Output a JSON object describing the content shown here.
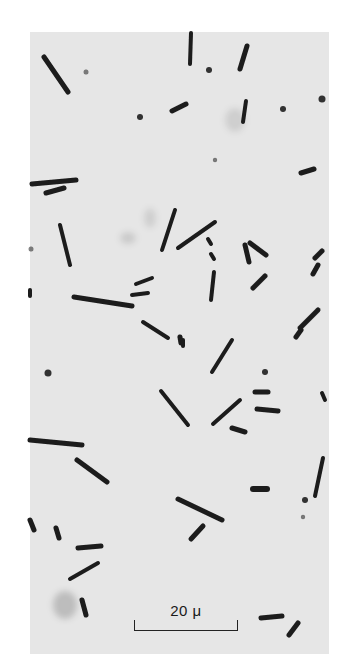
{
  "figure": {
    "type": "phase-contrast micrograph",
    "background_color": "#e6e6e6",
    "page_color": "#ffffff",
    "cell_color": "#1c1c1c",
    "frame": {
      "x": 30,
      "y": 32,
      "width": 299,
      "height": 622
    }
  },
  "scale_bar": {
    "label": "20 μ",
    "x_start": 134,
    "x_end": 238,
    "y": 631
  },
  "cells": [
    {
      "x1": 44,
      "y1": 57,
      "x2": 68,
      "y2": 92,
      "w": 5
    },
    {
      "x1": 191,
      "y1": 33,
      "x2": 190,
      "y2": 64,
      "w": 4
    },
    {
      "x1": 247,
      "y1": 46,
      "x2": 240,
      "y2": 69,
      "w": 5
    },
    {
      "x1": 172,
      "y1": 111,
      "x2": 186,
      "y2": 104,
      "w": 5
    },
    {
      "x1": 246,
      "y1": 101,
      "x2": 243,
      "y2": 122,
      "w": 4
    },
    {
      "x1": 301,
      "y1": 173,
      "x2": 314,
      "y2": 169,
      "w": 5
    },
    {
      "x1": 32,
      "y1": 184,
      "x2": 76,
      "y2": 180,
      "w": 5
    },
    {
      "x1": 46,
      "y1": 193,
      "x2": 64,
      "y2": 188,
      "w": 5
    },
    {
      "x1": 60,
      "y1": 225,
      "x2": 70,
      "y2": 265,
      "w": 4
    },
    {
      "x1": 175,
      "y1": 210,
      "x2": 162,
      "y2": 250,
      "w": 4
    },
    {
      "x1": 178,
      "y1": 248,
      "x2": 215,
      "y2": 222,
      "w": 4
    },
    {
      "x1": 208,
      "y1": 239,
      "x2": 211,
      "y2": 244,
      "w": 4
    },
    {
      "x1": 211,
      "y1": 254,
      "x2": 214,
      "y2": 259,
      "w": 4
    },
    {
      "x1": 74,
      "y1": 297,
      "x2": 132,
      "y2": 306,
      "w": 5
    },
    {
      "x1": 132,
      "y1": 295,
      "x2": 148,
      "y2": 293,
      "w": 4
    },
    {
      "x1": 136,
      "y1": 284,
      "x2": 152,
      "y2": 278,
      "w": 4
    },
    {
      "x1": 245,
      "y1": 245,
      "x2": 249,
      "y2": 262,
      "w": 5
    },
    {
      "x1": 250,
      "y1": 243,
      "x2": 266,
      "y2": 255,
      "w": 5
    },
    {
      "x1": 253,
      "y1": 288,
      "x2": 265,
      "y2": 276,
      "w": 5
    },
    {
      "x1": 214,
      "y1": 272,
      "x2": 211,
      "y2": 300,
      "w": 4
    },
    {
      "x1": 322,
      "y1": 251,
      "x2": 315,
      "y2": 258,
      "w": 5
    },
    {
      "x1": 318,
      "y1": 265,
      "x2": 313,
      "y2": 274,
      "w": 5
    },
    {
      "x1": 300,
      "y1": 328,
      "x2": 318,
      "y2": 310,
      "w": 5
    },
    {
      "x1": 296,
      "y1": 337,
      "x2": 301,
      "y2": 330,
      "w": 5
    },
    {
      "x1": 143,
      "y1": 322,
      "x2": 168,
      "y2": 338,
      "w": 4
    },
    {
      "x1": 180,
      "y1": 337,
      "x2": 181,
      "y2": 343,
      "w": 5
    },
    {
      "x1": 212,
      "y1": 372,
      "x2": 232,
      "y2": 340,
      "w": 4
    },
    {
      "x1": 183,
      "y1": 340,
      "x2": 183,
      "y2": 346,
      "w": 4
    },
    {
      "x1": 30,
      "y1": 440,
      "x2": 82,
      "y2": 445,
      "w": 5
    },
    {
      "x1": 161,
      "y1": 391,
      "x2": 188,
      "y2": 425,
      "w": 4
    },
    {
      "x1": 213,
      "y1": 424,
      "x2": 240,
      "y2": 400,
      "w": 4
    },
    {
      "x1": 232,
      "y1": 428,
      "x2": 245,
      "y2": 432,
      "w": 5
    },
    {
      "x1": 257,
      "y1": 409,
      "x2": 278,
      "y2": 411,
      "w": 5
    },
    {
      "x1": 255,
      "y1": 392,
      "x2": 268,
      "y2": 392,
      "w": 5
    },
    {
      "x1": 77,
      "y1": 460,
      "x2": 107,
      "y2": 482,
      "w": 5
    },
    {
      "x1": 30,
      "y1": 520,
      "x2": 34,
      "y2": 530,
      "w": 5
    },
    {
      "x1": 56,
      "y1": 528,
      "x2": 59,
      "y2": 538,
      "w": 5
    },
    {
      "x1": 78,
      "y1": 548,
      "x2": 101,
      "y2": 546,
      "w": 5
    },
    {
      "x1": 70,
      "y1": 579,
      "x2": 98,
      "y2": 563,
      "w": 4
    },
    {
      "x1": 178,
      "y1": 499,
      "x2": 222,
      "y2": 520,
      "w": 5
    },
    {
      "x1": 191,
      "y1": 539,
      "x2": 203,
      "y2": 526,
      "w": 5
    },
    {
      "x1": 253,
      "y1": 489,
      "x2": 267,
      "y2": 489,
      "w": 6
    },
    {
      "x1": 323,
      "y1": 458,
      "x2": 315,
      "y2": 496,
      "w": 4
    },
    {
      "x1": 322,
      "y1": 393,
      "x2": 325,
      "y2": 400,
      "w": 4
    },
    {
      "x1": 82,
      "y1": 600,
      "x2": 86,
      "y2": 615,
      "w": 5
    },
    {
      "x1": 261,
      "y1": 618,
      "x2": 282,
      "y2": 616,
      "w": 5
    },
    {
      "x1": 289,
      "y1": 635,
      "x2": 298,
      "y2": 623,
      "w": 5
    },
    {
      "x1": 30,
      "y1": 290,
      "x2": 30,
      "y2": 296,
      "w": 4
    }
  ],
  "dots": [
    {
      "x": 48,
      "y": 373,
      "r": 3.5
    },
    {
      "x": 140,
      "y": 117,
      "r": 3
    },
    {
      "x": 265,
      "y": 372,
      "r": 3
    },
    {
      "x": 305,
      "y": 500,
      "r": 3
    },
    {
      "x": 303,
      "y": 517,
      "r": 2.2
    },
    {
      "x": 322,
      "y": 99,
      "r": 3.5
    },
    {
      "x": 215,
      "y": 160,
      "r": 2.2
    },
    {
      "x": 31,
      "y": 249,
      "r": 2.5
    },
    {
      "x": 86,
      "y": 72,
      "r": 2.5
    },
    {
      "x": 209,
      "y": 70,
      "r": 3
    },
    {
      "x": 283,
      "y": 109,
      "r": 3
    }
  ],
  "blobs": [
    {
      "x": 65,
      "y": 605,
      "rx": 12,
      "ry": 14,
      "o": 0.18
    },
    {
      "x": 128,
      "y": 238,
      "rx": 8,
      "ry": 6,
      "o": 0.12
    },
    {
      "x": 235,
      "y": 120,
      "rx": 10,
      "ry": 12,
      "o": 0.1
    },
    {
      "x": 150,
      "y": 218,
      "rx": 6,
      "ry": 10,
      "o": 0.1
    }
  ]
}
